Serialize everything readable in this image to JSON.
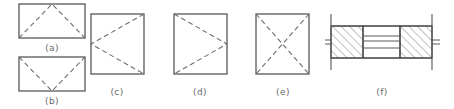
{
  "diagram": {
    "type": "engineering-line-drawing",
    "canvas": {
      "width": 454,
      "height": 109
    },
    "colors": {
      "solid_outline": "#4a4a4a",
      "dashed_fold": "#6e6e6e",
      "hatch": "#6b6b6b",
      "caption": "#6a6a6a",
      "background": "#ffffff"
    },
    "line_styles": {
      "outline": "solid",
      "fold": "dashed",
      "hatch": "solid-diagonal"
    },
    "figures": [
      {
        "id": "a",
        "label": "(a)",
        "shape": "rectangle",
        "outline": {
          "x": 19,
          "y": 4,
          "width": 66,
          "height": 34
        },
        "fold_description": "inverted-V apex at top-center to both bottom corners",
        "fold_lines": [
          {
            "from": [
              19,
              38
            ],
            "to": [
              52,
              4
            ]
          },
          {
            "from": [
              52,
              4
            ],
            "to": [
              85,
              38
            ]
          }
        ],
        "caption_position": [
          52,
          51
        ]
      },
      {
        "id": "b",
        "label": "(b)",
        "shape": "rectangle",
        "outline": {
          "x": 19,
          "y": 57,
          "width": 66,
          "height": 34
        },
        "fold_description": "V valley at bottom-center to both top corners",
        "fold_lines": [
          {
            "from": [
              19,
              57
            ],
            "to": [
              52,
              91
            ]
          },
          {
            "from": [
              52,
              91
            ],
            "to": [
              85,
              57
            ]
          }
        ],
        "caption_position": [
          52,
          104
        ]
      },
      {
        "id": "c",
        "label": "(c)",
        "shape": "square",
        "outline": {
          "x": 91,
          "y": 14,
          "width": 53,
          "height": 60
        },
        "fold_description": "chevron pointing left, apex at left-middle to top-right and bottom-right corners",
        "fold_lines": [
          {
            "from": [
              144,
              14
            ],
            "to": [
              91,
              44
            ]
          },
          {
            "from": [
              91,
              44
            ],
            "to": [
              144,
              74
            ]
          }
        ],
        "caption_position": [
          117,
          95
        ]
      },
      {
        "id": "d",
        "label": "(d)",
        "shape": "square",
        "outline": {
          "x": 174,
          "y": 14,
          "width": 53,
          "height": 60
        },
        "fold_description": "chevron pointing right, apex at right-middle to top-left and bottom-left corners",
        "fold_lines": [
          {
            "from": [
              174,
              14
            ],
            "to": [
              227,
              44
            ]
          },
          {
            "from": [
              227,
              44
            ],
            "to": [
              174,
              74
            ]
          }
        ],
        "caption_position": [
          200,
          95
        ]
      },
      {
        "id": "e",
        "label": "(e)",
        "shape": "square",
        "outline": {
          "x": 256,
          "y": 14,
          "width": 53,
          "height": 60
        },
        "fold_description": "X formed by both diagonals",
        "fold_lines": [
          {
            "from": [
              256,
              14
            ],
            "to": [
              309,
              74
            ]
          },
          {
            "from": [
              309,
              14
            ],
            "to": [
              256,
              74
            ]
          }
        ],
        "caption_position": [
          283,
          95
        ]
      },
      {
        "id": "f",
        "label": "(f)",
        "shape": "sectional-assembly",
        "outline": {
          "x": 331,
          "y": 26,
          "width": 101,
          "height": 32
        },
        "description": "cross-section: two cross-hatched solid blocks at left and right separated by a central layered channel of thin horizontal plates, bounded by vertical section lines at both ends",
        "blocks": [
          {
            "name": "left-hatched-block",
            "x": 331,
            "y": 26,
            "width": 32,
            "height": 32,
            "hatch_direction": "up-right"
          },
          {
            "name": "right-hatched-block",
            "x": 400,
            "y": 26,
            "width": 32,
            "height": 32,
            "hatch_direction": "up-right"
          }
        ],
        "channel": {
          "name": "central-plate-stack",
          "x": 363,
          "y": 26,
          "width": 37,
          "height": 32,
          "horizontal_plate_lines_y": [
            36,
            41,
            48
          ]
        },
        "section_markers": [
          {
            "name": "left-section-line",
            "x": 331,
            "y_top": 14,
            "y_bottom": 70
          },
          {
            "name": "right-section-line",
            "x": 432,
            "y_top": 14,
            "y_bottom": 70
          }
        ],
        "caption_position": [
          382,
          95
        ]
      }
    ]
  }
}
